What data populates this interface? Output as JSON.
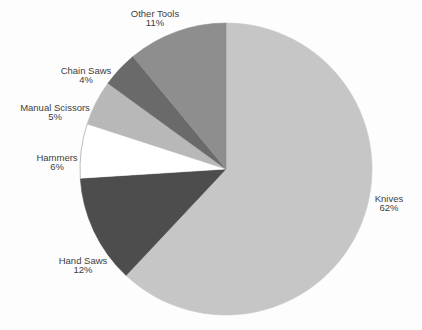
{
  "page": {
    "background_color": "#fdfdfd",
    "label_text_color": "#3e3e3e"
  },
  "chart_data": {
    "type": "pie",
    "title": "",
    "categories": [
      "Knives",
      "Hand Saws",
      "Hammers",
      "Manual Scissors",
      "Chain Saws",
      "Other Tools"
    ],
    "values": [
      62,
      12,
      6,
      5,
      4,
      11
    ],
    "unit": "%",
    "slices": [
      {
        "label": "Knives",
        "value": 62,
        "pct_text": "62%",
        "color": "#c6c6c6",
        "label_x": 389,
        "label_y": 198
      },
      {
        "label": "Hand Saws",
        "value": 12,
        "pct_text": "12%",
        "color": "#4d4d4d",
        "label_x": 83,
        "label_y": 260
      },
      {
        "label": "Hammers",
        "value": 6,
        "pct_text": "6%",
        "color": "#ffffff",
        "label_x": 57,
        "label_y": 157
      },
      {
        "label": "Manual Scissors",
        "value": 5,
        "pct_text": "5%",
        "color": "#b8b8b8",
        "label_x": 55,
        "label_y": 107
      },
      {
        "label": "Chain Saws",
        "value": 4,
        "pct_text": "4%",
        "color": "#6a6a6a",
        "label_x": 86,
        "label_y": 70
      },
      {
        "label": "Other Tools",
        "value": 11,
        "pct_text": "11%",
        "color": "#8e8e8e",
        "label_x": 155,
        "label_y": 13
      }
    ],
    "layout": {
      "center_x": 226,
      "center_y": 169,
      "radius": 146,
      "start_angle_deg": 0,
      "direction": "clockwise",
      "legend": "none",
      "labels": "outside-two-line",
      "label_line_spacing": 9,
      "white_slice_rim_color": "#bdbdbd"
    }
  }
}
